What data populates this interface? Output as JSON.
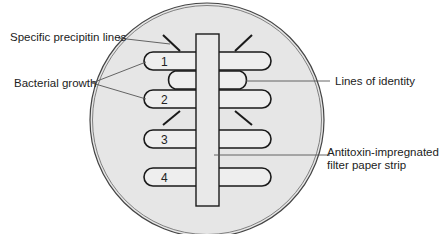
{
  "diagram": {
    "labels": {
      "precipitin": "Specific precipitin lines",
      "growth": "Bacterial growth",
      "identity": "Lines of identity",
      "strip_line1": "Antitoxin-impregnated",
      "strip_line2": "filter paper strip"
    },
    "streaks": [
      {
        "number": "1"
      },
      {
        "number": "2"
      },
      {
        "number": "3"
      },
      {
        "number": "4"
      }
    ],
    "colors": {
      "plate_fill": "#e6e6e6",
      "strip_fill": "#e9e9e9",
      "line": "#1a1a1a",
      "leader": "#555555"
    }
  }
}
